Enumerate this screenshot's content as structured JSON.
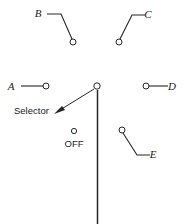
{
  "diagram": {
    "background_color": "#ffffff",
    "line_color": "#262626",
    "labels": {
      "terminal_a": "A",
      "terminal_b": "B",
      "terminal_c": "C",
      "terminal_d": "D",
      "terminal_e": "E",
      "off_position": "OFF",
      "selector_callout": "Selector"
    },
    "terminals": [
      {
        "id": "A",
        "label": "A",
        "label_x": 11,
        "label_y": 90,
        "node_x": 46,
        "node_y": 86,
        "node_r": 3,
        "path": "M 21 86 L 43 86"
      },
      {
        "id": "B",
        "label": "B",
        "label_x": 38,
        "label_y": 17,
        "node_x": 73,
        "node_y": 42,
        "node_r": 3,
        "path": "M 47 14 L 61 14 L 72 39"
      },
      {
        "id": "C",
        "label": "C",
        "label_x": 148,
        "label_y": 18,
        "node_x": 119,
        "node_y": 42,
        "node_r": 3,
        "path": "M 145 15 L 132 15 L 120 39"
      },
      {
        "id": "D",
        "label": "D",
        "label_x": 172,
        "label_y": 90,
        "node_x": 146,
        "node_y": 86,
        "node_r": 3,
        "path": "M 149 86 L 168 86"
      },
      {
        "id": "E",
        "label": "E",
        "label_x": 153,
        "label_y": 158,
        "node_x": 122,
        "node_y": 130,
        "node_r": 3,
        "path": "M 123 133 L 137 155 L 150 155"
      }
    ],
    "off_position": {
      "label": "OFF",
      "node_x": 74,
      "node_y": 131,
      "node_r": 2.6,
      "label_x": 74,
      "label_y": 147
    },
    "selector": {
      "pivot_x": 97,
      "pivot_y": 86,
      "pivot_r": 3.2,
      "lever_path": "M 97.5 90 L 97.5 224",
      "callout_text": "Selector",
      "callout_x": 14,
      "callout_y": 114,
      "leader_path": "M 94 89 L 60 110",
      "arrow_points": "54,114 65,110 62,106"
    }
  }
}
